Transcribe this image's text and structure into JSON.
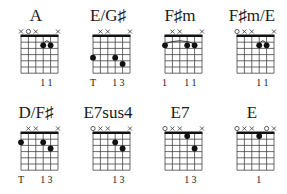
{
  "chords": [
    {
      "name": "A",
      "x": 0,
      "y": 0,
      "markers": [
        "x",
        "o",
        "x",
        "",
        "",
        "x"
      ],
      "dots": [
        {
          "s": 3,
          "f": 2
        },
        {
          "s": 4,
          "f": 2
        }
      ],
      "barre": {
        "from": 3,
        "to": 4,
        "f": 2
      },
      "fingers": [
        "",
        "",
        "",
        "1",
        "1",
        ""
      ]
    },
    {
      "name": "E/G♯",
      "x": 72,
      "y": 0,
      "markers": [
        "",
        "x",
        "x",
        "",
        "",
        "x"
      ],
      "dots": [
        {
          "s": 0,
          "f": 4
        },
        {
          "s": 3,
          "f": 4
        },
        {
          "s": 4,
          "f": 5
        }
      ],
      "barre": null,
      "fingers": [
        "T",
        "",
        "",
        "1",
        "3",
        ""
      ]
    },
    {
      "name": "F♯m",
      "x": 144,
      "y": 0,
      "markers": [
        "",
        "x",
        "x",
        "",
        "",
        "x"
      ],
      "dots": [
        {
          "s": 0,
          "f": 2
        },
        {
          "s": 3,
          "f": 2
        },
        {
          "s": 4,
          "f": 2
        }
      ],
      "barre": {
        "from": 0,
        "to": 4,
        "f": 2
      },
      "fingers": [
        "1",
        "",
        "",
        "1",
        "1",
        ""
      ]
    },
    {
      "name": "F♯m/E",
      "x": 216,
      "y": 0,
      "markers": [
        "o",
        "x",
        "x",
        "",
        "",
        "x"
      ],
      "dots": [
        {
          "s": 3,
          "f": 2
        },
        {
          "s": 4,
          "f": 2
        }
      ],
      "barre": {
        "from": 3,
        "to": 4,
        "f": 2
      },
      "fingers": [
        "",
        "",
        "",
        "1",
        "1",
        ""
      ]
    },
    {
      "name": "D/F♯",
      "x": 0,
      "y": 97,
      "markers": [
        "",
        "x",
        "x",
        "",
        "",
        "x"
      ],
      "dots": [
        {
          "s": 0,
          "f": 2
        },
        {
          "s": 3,
          "f": 2
        },
        {
          "s": 4,
          "f": 3
        }
      ],
      "barre": null,
      "fingers": [
        "T",
        "",
        "",
        "1",
        "3",
        ""
      ]
    },
    {
      "name": "E7sus4",
      "x": 72,
      "y": 97,
      "markers": [
        "o",
        "x",
        "x",
        "",
        "",
        "x"
      ],
      "dots": [
        {
          "s": 3,
          "f": 2
        },
        {
          "s": 4,
          "f": 3
        }
      ],
      "barre": null,
      "fingers": [
        "",
        "",
        "",
        "1",
        "3",
        ""
      ]
    },
    {
      "name": "E7",
      "x": 144,
      "y": 97,
      "markers": [
        "o",
        "x",
        "x",
        "",
        "",
        "x"
      ],
      "dots": [
        {
          "s": 3,
          "f": 1
        },
        {
          "s": 4,
          "f": 3
        }
      ],
      "barre": null,
      "fingers": [
        "",
        "",
        "",
        "1",
        "3",
        ""
      ]
    },
    {
      "name": "E",
      "x": 216,
      "y": 97,
      "markers": [
        "o",
        "x",
        "x",
        "",
        "o",
        "x"
      ],
      "dots": [
        {
          "s": 3,
          "f": 1
        }
      ],
      "barre": null,
      "fingers": [
        "",
        "",
        "",
        "1",
        "",
        ""
      ]
    }
  ]
}
